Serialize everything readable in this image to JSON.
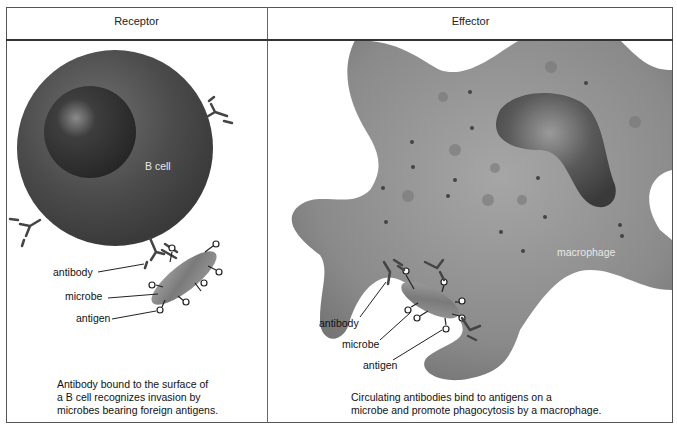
{
  "header": {
    "columns": [
      {
        "title": "Receptor"
      },
      {
        "title": "Effector"
      }
    ]
  },
  "receptor": {
    "cell_label": "B cell",
    "labels": {
      "antibody": "antibody",
      "microbe": "microbe",
      "antigen": "antigen"
    },
    "caption_lines": [
      "Antibody bound to the surface of",
      "a B cell recognizes invasion by",
      "microbes bearing foreign antigens."
    ]
  },
  "effector": {
    "cell_label": "macrophage",
    "labels": {
      "antibody": "antibody",
      "microbe": "microbe",
      "antigen": "antigen"
    },
    "caption_lines": [
      "Circulating antibodies bind to antigens on a",
      "microbe and promote phagocytosis by a macrophage."
    ]
  },
  "colors": {
    "cell_dark": "#4a4a4a",
    "macrophage": "#8a8a8a",
    "microbe": "#8f8f8f",
    "border": "#555555"
  }
}
